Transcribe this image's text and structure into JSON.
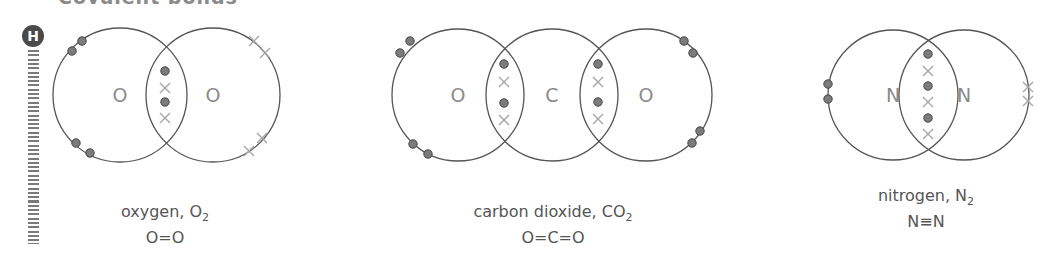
{
  "heading": "Covalent bonds",
  "badge": {
    "label": "H",
    "icon": "higher-tier-badge"
  },
  "colors": {
    "circle_stroke": "#555555",
    "dot_fill": "#7c7c7c",
    "dot_stroke": "#444444",
    "cross": "#a8a8a8",
    "atom_label": "#8a8a8a",
    "caption": "#555555"
  },
  "molecules": [
    {
      "name": "oxygen",
      "formula_base": "O",
      "formula_sub": "2",
      "caption_prefix": "oxygen, ",
      "structural": "O=O",
      "atoms": [
        {
          "symbol": "O",
          "cx": 120,
          "cy": 95,
          "r": 67
        },
        {
          "symbol": "O",
          "cx": 213,
          "cy": 95,
          "r": 67
        }
      ],
      "dots": [
        [
          72,
          51
        ],
        [
          82,
          41
        ],
        [
          76,
          143
        ],
        [
          90,
          153
        ],
        [
          165,
          71
        ],
        [
          165,
          102
        ]
      ],
      "crosses": [
        [
          165,
          88
        ],
        [
          165,
          118
        ],
        [
          254,
          41
        ],
        [
          265,
          53
        ],
        [
          262,
          138
        ],
        [
          249,
          151
        ]
      ]
    },
    {
      "name": "carbon dioxide",
      "formula_base": "CO",
      "formula_sub": "2",
      "caption_prefix": "carbon dioxide, ",
      "structural": "O=C=O",
      "atoms": [
        {
          "symbol": "O",
          "cx": 458,
          "cy": 95,
          "r": 66
        },
        {
          "symbol": "C",
          "cx": 552,
          "cy": 95,
          "r": 66
        },
        {
          "symbol": "O",
          "cx": 646,
          "cy": 95,
          "r": 66
        }
      ],
      "dots": [
        [
          410,
          41
        ],
        [
          400,
          53
        ],
        [
          413,
          144
        ],
        [
          428,
          154
        ],
        [
          504,
          64
        ],
        [
          504,
          103
        ],
        [
          598,
          64
        ],
        [
          598,
          102
        ],
        [
          684,
          41
        ],
        [
          693,
          53
        ],
        [
          700,
          131
        ],
        [
          692,
          143
        ]
      ],
      "crosses": [
        [
          504,
          82
        ],
        [
          504,
          120
        ],
        [
          598,
          82
        ],
        [
          598,
          119
        ]
      ]
    },
    {
      "name": "nitrogen",
      "formula_base": "N",
      "formula_sub": "2",
      "caption_prefix": "nitrogen, ",
      "structural": "N≡N",
      "atoms": [
        {
          "symbol": "N",
          "cx": 893,
          "cy": 95,
          "r": 65
        },
        {
          "symbol": "N",
          "cx": 964,
          "cy": 95,
          "r": 65
        }
      ],
      "dots": [
        [
          928,
          54
        ],
        [
          928,
          86
        ],
        [
          928,
          118
        ],
        [
          828,
          84
        ],
        [
          828,
          99
        ]
      ],
      "crosses": [
        [
          928,
          71
        ],
        [
          928,
          102
        ],
        [
          928,
          134
        ],
        [
          1028,
          87
        ],
        [
          1028,
          101
        ]
      ]
    }
  ],
  "captions": [
    {
      "line1_prefix": "oxygen, ",
      "line1_base": "O",
      "line1_sub": "2",
      "line2": "O=O",
      "cx": 165,
      "top": 202
    },
    {
      "line1_prefix": "carbon dioxide, ",
      "line1_base": "CO",
      "line1_sub": "2",
      "line2": "O=C=O",
      "cx": 553,
      "top": 202
    },
    {
      "line1_prefix": "nitrogen, ",
      "line1_base": "N",
      "line1_sub": "2",
      "line2": "N≡N",
      "cx": 926,
      "top": 186
    }
  ]
}
